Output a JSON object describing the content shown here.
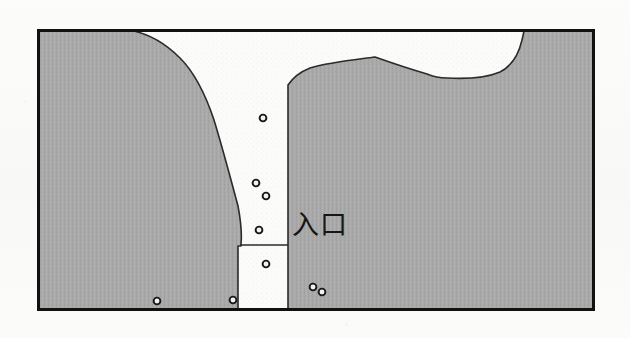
{
  "figure": {
    "kind": "plan-map",
    "caption_label": "入口",
    "caption_reading": "iriguchi (entrance)",
    "frame": {
      "x": 37,
      "y": 29,
      "width": 558,
      "height": 282,
      "border_color": "#111111",
      "border_width": 3
    },
    "colors": {
      "rock_fill": "#a9a9a9",
      "rock_outline": "#2b2b2b",
      "passage_fill": "#fbfbfa",
      "frame_border": "#111111",
      "marker_stroke": "#1a1a1a",
      "marker_fill": "#f2f2f0",
      "page_background": "#fbfbfa"
    },
    "regions": [
      {
        "name": "left-rock-mass",
        "description": "Large shaded rock body occupying the left and lower portion of the frame",
        "path": "M 38 30 L 128 30 C 148 33 166 44 180 58 C 196 74 206 96 214 120 C 222 146 230 176 238 206 C 241 222 242 234 241 244 L 241 246 L 238 246 C 238 246 238 310 238 310 L 38 310 Z"
      },
      {
        "name": "right-rock-mass",
        "description": "Shaded rock body on the right with a peak and a white notch at the upper right corner",
        "path": "M 288 85 C 292 79 300 72 310 68 C 330 62 352 60 375 57 C 392 63 410 69 427 74 C 434 77 440 78 447 78 C 466 79 486 78 500 72 C 512 66 519 53 522 40 C 523 36 524 32 524 30 L 594 30 L 594 310 L 288 310 Z"
      },
      {
        "name": "central-passage",
        "description": "Unshaded tapering corridor leading down from the top of the frame to the entrance",
        "path": "M 128 30 L 524 30 C 524 32 523 36 522 40 C 519 53 512 66 500 72 C 486 78 466 79 447 78 C 440 78 434 77 427 74 C 410 69 392 63 375 57 C 352 60 330 62 310 68 C 300 72 292 79 288 85 L 288 245 L 240 245 C 241 234 241 222 238 206 C 230 176 222 146 214 120 C 206 96 196 74 180 58 C 166 44 148 33 128 30 Z"
      }
    ],
    "markers": [
      {
        "id": "m1",
        "x": 263,
        "y": 118,
        "r": 3.4,
        "location": "passage"
      },
      {
        "id": "m2",
        "x": 256,
        "y": 183,
        "r": 3.4,
        "location": "passage"
      },
      {
        "id": "m3",
        "x": 266,
        "y": 196,
        "r": 3.4,
        "location": "passage"
      },
      {
        "id": "m4",
        "x": 259,
        "y": 230,
        "r": 3.4,
        "location": "passage"
      },
      {
        "id": "m5",
        "x": 266,
        "y": 264,
        "r": 3.4,
        "location": "rock"
      },
      {
        "id": "m6",
        "x": 313,
        "y": 287,
        "r": 3.4,
        "location": "rock"
      },
      {
        "id": "m7",
        "x": 322,
        "y": 292,
        "r": 3.4,
        "location": "rock"
      },
      {
        "id": "m8",
        "x": 157,
        "y": 301,
        "r": 3.4,
        "location": "rock"
      },
      {
        "id": "m9",
        "x": 233,
        "y": 300,
        "r": 3.4,
        "location": "rock"
      }
    ],
    "marker_count": 9
  }
}
